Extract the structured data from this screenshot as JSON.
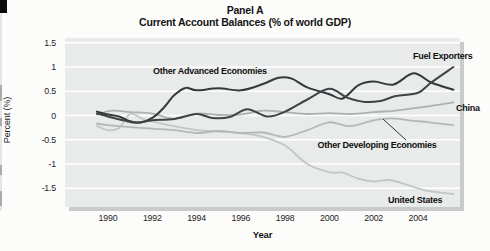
{
  "page": {
    "artifact_note": "scanned-page edge marks at far left"
  },
  "title": {
    "line1": "Panel A",
    "line2": "Current Account Balances (% of world GDP)"
  },
  "axes": {
    "y_label": "Percent (%)",
    "x_label": "Year",
    "y_ticks": [
      {
        "label": "1.5",
        "value": 1.5
      },
      {
        "label": "1",
        "value": 1.0
      },
      {
        "label": "0.5",
        "value": 0.5
      },
      {
        "label": "0",
        "value": 0.0
      },
      {
        "label": "-0.5",
        "value": -0.5
      },
      {
        "label": "-1",
        "value": -1.0
      },
      {
        "label": "-1.5",
        "value": -1.5
      }
    ],
    "x_ticks": [
      {
        "label": "1990",
        "value": 1990
      },
      {
        "label": "1992",
        "value": 1992
      },
      {
        "label": "1994",
        "value": 1994
      },
      {
        "label": "1996",
        "value": 1996
      },
      {
        "label": "1998",
        "value": 1998
      },
      {
        "label": "2000",
        "value": 2000
      },
      {
        "label": "2002",
        "value": 2002
      },
      {
        "label": "2004",
        "value": 2004
      }
    ]
  },
  "chart_data": {
    "type": "line",
    "xlabel": "Year",
    "ylabel": "Percent (%)",
    "xlim": [
      1988.1,
      2005.9
    ],
    "ylim": [
      -1.9,
      1.6
    ],
    "grid": "horizontal white gridlines every 0.5",
    "legend_position": "labels drawn next to lines",
    "colors": {
      "plot_background": "#e9eaea",
      "gridline": "#ffffff",
      "dark_line": "#3a3d3f",
      "light_line": "#b2b7b4",
      "shadow": "#c9cbca"
    },
    "series": [
      {
        "name": "United States",
        "color": "#c3c7c4",
        "width": 1.8,
        "points": [
          [
            1989.5,
            -0.22
          ],
          [
            1990,
            -0.3
          ],
          [
            1990.5,
            -0.26
          ],
          [
            1991,
            0.03
          ],
          [
            1991.6,
            -0.08
          ],
          [
            1992,
            -0.12
          ],
          [
            1993,
            -0.22
          ],
          [
            1994,
            -0.3
          ],
          [
            1995,
            -0.33
          ],
          [
            1996,
            -0.36
          ],
          [
            1997,
            -0.44
          ],
          [
            1998,
            -0.62
          ],
          [
            1999,
            -1.0
          ],
          [
            2000,
            -1.17
          ],
          [
            2000.6,
            -1.18
          ],
          [
            2001.3,
            -1.3
          ],
          [
            2002,
            -1.36
          ],
          [
            2002.7,
            -1.33
          ],
          [
            2003.3,
            -1.4
          ],
          [
            2004,
            -1.5
          ],
          [
            2004.5,
            -1.56
          ],
          [
            2005.6,
            -1.62
          ]
        ]
      },
      {
        "name": "Other Developing Economies",
        "color": "#b4b9b6",
        "width": 1.8,
        "points": [
          [
            1989.5,
            -0.17
          ],
          [
            1990,
            -0.2
          ],
          [
            1991,
            -0.24
          ],
          [
            1992,
            -0.27
          ],
          [
            1993,
            -0.3
          ],
          [
            1994,
            -0.36
          ],
          [
            1995,
            -0.32
          ],
          [
            1996,
            -0.36
          ],
          [
            1997,
            -0.35
          ],
          [
            1998,
            -0.44
          ],
          [
            1999,
            -0.3
          ],
          [
            2000,
            -0.14
          ],
          [
            2000.9,
            -0.22
          ],
          [
            2002,
            -0.1
          ],
          [
            2002.8,
            -0.06
          ],
          [
            2003.6,
            -0.1
          ],
          [
            2004.5,
            -0.14
          ],
          [
            2005.6,
            -0.2
          ]
        ]
      },
      {
        "name": "China",
        "color": "#adb2af",
        "width": 1.8,
        "points": [
          [
            1989.5,
            0.02
          ],
          [
            1990.2,
            0.1
          ],
          [
            1991,
            0.07
          ],
          [
            1992,
            0.04
          ],
          [
            1993,
            -0.07
          ],
          [
            1994,
            0.04
          ],
          [
            1995,
            0.01
          ],
          [
            1996,
            0.02
          ],
          [
            1997,
            0.1
          ],
          [
            1998,
            0.07
          ],
          [
            1999,
            0.03
          ],
          [
            2000,
            0.05
          ],
          [
            2001,
            0.03
          ],
          [
            2002,
            0.07
          ],
          [
            2003,
            0.1
          ],
          [
            2004,
            0.16
          ],
          [
            2005.6,
            0.27
          ]
        ]
      },
      {
        "name": "Other Advanced Economies",
        "color": "#35383a",
        "width": 2,
        "points": [
          [
            1989.5,
            0.08
          ],
          [
            1990,
            0.02
          ],
          [
            1990.5,
            -0.02
          ],
          [
            1991,
            -0.12
          ],
          [
            1991.5,
            -0.14
          ],
          [
            1992,
            -0.05
          ],
          [
            1992.5,
            0.15
          ],
          [
            1993,
            0.42
          ],
          [
            1993.5,
            0.57
          ],
          [
            1994,
            0.52
          ],
          [
            1995,
            0.56
          ],
          [
            1996,
            0.52
          ],
          [
            1997,
            0.65
          ],
          [
            1997.7,
            0.78
          ],
          [
            1998.3,
            0.76
          ],
          [
            1999,
            0.58
          ],
          [
            2000,
            0.44
          ],
          [
            2000.6,
            0.35
          ],
          [
            2001.3,
            0.62
          ],
          [
            2002,
            0.7
          ],
          [
            2002.9,
            0.64
          ],
          [
            2003.8,
            0.87
          ],
          [
            2004.6,
            0.68
          ],
          [
            2005.6,
            0.53
          ]
        ]
      },
      {
        "name": "Fuel Exporters",
        "color": "#404346",
        "width": 2,
        "points": [
          [
            1989.5,
            0.04
          ],
          [
            1990,
            -0.02
          ],
          [
            1990.7,
            -0.1
          ],
          [
            1991.3,
            -0.15
          ],
          [
            1992,
            -0.1
          ],
          [
            1993,
            -0.07
          ],
          [
            1994,
            0.03
          ],
          [
            1994.7,
            -0.05
          ],
          [
            1995.5,
            -0.03
          ],
          [
            1996.3,
            0.13
          ],
          [
            1997.2,
            -0.02
          ],
          [
            1998,
            0.08
          ],
          [
            1999,
            0.33
          ],
          [
            2000,
            0.55
          ],
          [
            2000.8,
            0.37
          ],
          [
            2001.6,
            0.28
          ],
          [
            2002.3,
            0.3
          ],
          [
            2003,
            0.4
          ],
          [
            2004,
            0.47
          ],
          [
            2004.6,
            0.68
          ],
          [
            2005.6,
            1.0
          ]
        ]
      }
    ],
    "annotations": [
      {
        "text": "Other Advanced Economies",
        "attached_to": "Other Advanced Economies",
        "position": "above line, years 1993-1997"
      },
      {
        "text": "Fuel Exporters",
        "attached_to": "Fuel Exporters",
        "position": "top right, at line end"
      },
      {
        "text": "China",
        "attached_to": "China",
        "position": "right of line end"
      },
      {
        "text": "Other Developing Economies",
        "attached_to": "Other Developing Economies",
        "position": "below line with callout segment",
        "callout_px": [
          383,
          119,
          406,
          140
        ]
      },
      {
        "text": "United States",
        "attached_to": "United States",
        "position": "above line end, bottom right"
      }
    ]
  }
}
